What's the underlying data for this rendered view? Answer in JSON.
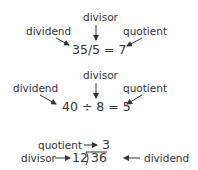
{
  "examples": [
    {
      "equation": "35/5 = 7",
      "labels": {
        "dividend": "dividend",
        "divisor": "divisor",
        "quotient": "quotient"
      }
    },
    {
      "equation": "40 ÷ 8 = 5",
      "labels": {
        "dividend": "dividend",
        "divisor": "divisor",
        "quotient": "quotient"
      }
    },
    {
      "quotient_value": "3",
      "divisor_value": "12",
      "dividend_value": "36",
      "labels": {
        "dividend": "dividend",
        "divisor": "divisor",
        "quotient": "quotient"
      }
    }
  ]
}
